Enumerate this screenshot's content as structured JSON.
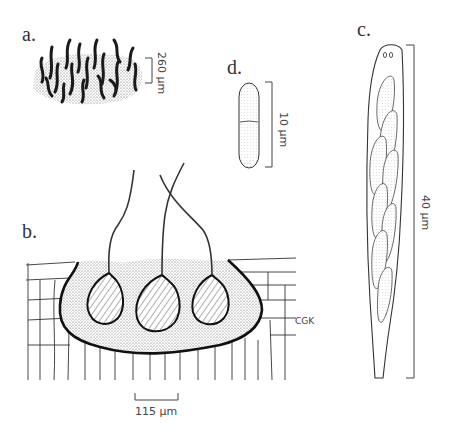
{
  "figure": {
    "panels": [
      {
        "id": "a",
        "label": "a.",
        "scale_bar": "260 µm",
        "description": "colony of dark curved setae/beaks on stippled stroma, surface view"
      },
      {
        "id": "b",
        "label": "b.",
        "scale_bar": "115 µm",
        "description": "vertical section of stroma in host tissue showing three perithecia with long necks"
      },
      {
        "id": "c",
        "label": "c.",
        "scale_bar": "40 µm",
        "description": "elongate ascus containing overlapping ascospores, apical ring at tip"
      },
      {
        "id": "d",
        "label": "d.",
        "scale_bar": "10 µm",
        "description": "two-celled ascospore"
      }
    ],
    "signature": "CGK"
  }
}
